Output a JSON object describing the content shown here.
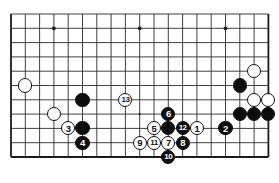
{
  "diagram": {
    "kind": "go-board-diagram",
    "board": {
      "cols": 19,
      "rows": 11,
      "left": 11,
      "top": 14,
      "spacing": 14.3,
      "line_color": "#2b2b2b",
      "border_color": "#1a1a1a",
      "background": "#ffffff",
      "star_points": [
        {
          "col": 3,
          "row": 1
        },
        {
          "col": 9,
          "row": 1
        },
        {
          "col": 15,
          "row": 1
        },
        {
          "col": 9,
          "row": 7
        }
      ]
    },
    "colors": {
      "black_stone": "#0d0d0d",
      "white_stone": "#ffffff",
      "black_label": "#ffffff",
      "white_label": "#111111"
    },
    "stones": [
      {
        "id": "w-upper-right-a",
        "col": 17,
        "row": 4,
        "color": "white",
        "label": ""
      },
      {
        "id": "b-upper-right-a",
        "col": 16,
        "row": 5,
        "color": "black",
        "label": ""
      },
      {
        "id": "w-right-a",
        "col": 17,
        "row": 6,
        "color": "white",
        "label": ""
      },
      {
        "id": "w-right-b",
        "col": 18,
        "row": 6,
        "color": "white",
        "label": ""
      },
      {
        "id": "b-right-a",
        "col": 16,
        "row": 7,
        "color": "black",
        "label": ""
      },
      {
        "id": "b-right-b",
        "col": 17,
        "row": 7,
        "color": "black",
        "label": ""
      },
      {
        "id": "b-right-c",
        "col": 18,
        "row": 7,
        "color": "black",
        "label": ""
      },
      {
        "id": "w-left-a",
        "col": 1,
        "row": 5,
        "color": "white",
        "label": ""
      },
      {
        "id": "w-left-b",
        "col": 3,
        "row": 7,
        "color": "white",
        "label": ""
      },
      {
        "id": "b-left-a",
        "col": 5,
        "row": 6,
        "color": "black",
        "label": ""
      },
      {
        "id": "b-left-b",
        "col": 5,
        "row": 8,
        "color": "black",
        "label": ""
      },
      {
        "id": "move-1",
        "col": 13,
        "row": 8,
        "color": "white",
        "label": "1"
      },
      {
        "id": "move-2",
        "col": 15,
        "row": 8,
        "color": "black",
        "label": "2"
      },
      {
        "id": "move-3",
        "col": 4,
        "row": 8,
        "color": "white",
        "label": "3"
      },
      {
        "id": "move-4",
        "col": 5,
        "row": 9,
        "color": "black",
        "label": "4"
      },
      {
        "id": "move-5",
        "col": 10,
        "row": 8,
        "color": "white",
        "label": "5"
      },
      {
        "id": "move-6",
        "col": 11,
        "row": 7,
        "color": "black",
        "label": "6"
      },
      {
        "id": "move-7",
        "col": 11,
        "row": 9,
        "color": "white",
        "label": "7"
      },
      {
        "id": "move-8",
        "col": 12,
        "row": 9,
        "color": "black",
        "label": "8"
      },
      {
        "id": "move-9",
        "col": 9,
        "row": 9,
        "color": "white",
        "label": "9"
      },
      {
        "id": "move-10",
        "col": 11,
        "row": 10,
        "color": "black",
        "label": "10"
      },
      {
        "id": "move-11",
        "col": 10,
        "row": 9,
        "color": "white",
        "label": "11"
      },
      {
        "id": "move-12",
        "col": 12,
        "row": 8,
        "color": "black",
        "label": "12"
      },
      {
        "id": "move-13",
        "col": 8,
        "row": 6,
        "color": "white",
        "label": "13"
      },
      {
        "id": "b-center-a",
        "col": 11,
        "row": 8,
        "color": "black",
        "label": ""
      }
    ]
  }
}
